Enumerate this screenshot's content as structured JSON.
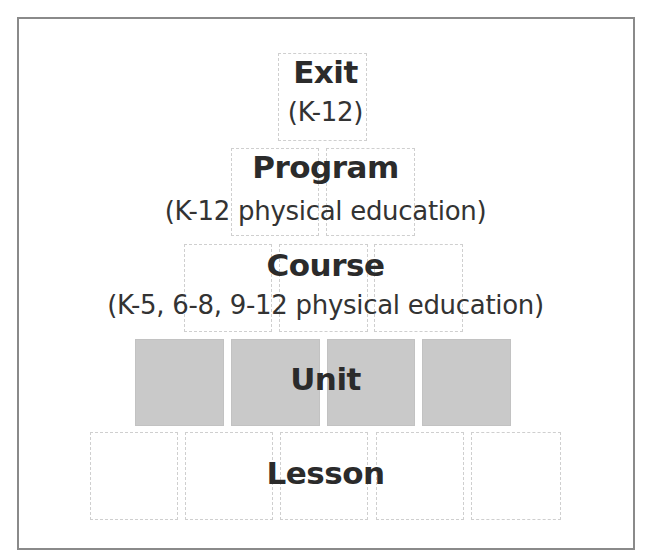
{
  "diagram": {
    "levels": [
      {
        "name": "Exit",
        "subtitle": "(K-12)",
        "box_count": 1,
        "filled": false
      },
      {
        "name": "Program",
        "subtitle": "(K-12 physical education)",
        "box_count": 2,
        "filled": false
      },
      {
        "name": "Course",
        "subtitle": "(K-5, 6-8, 9-12 physical education)",
        "box_count": 3,
        "filled": false
      },
      {
        "name": "Unit",
        "subtitle": "",
        "box_count": 4,
        "filled": true
      },
      {
        "name": "Lesson",
        "subtitle": "",
        "box_count": 5,
        "filled": false
      }
    ],
    "colors": {
      "frame": "#8a8a8a",
      "box_outline": "#cfcfcf",
      "highlight_fill": "#c9c9c9",
      "text": "#2b2b2b"
    }
  }
}
